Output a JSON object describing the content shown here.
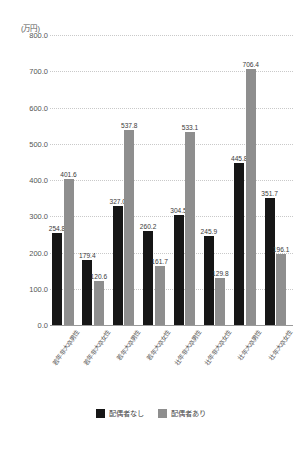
{
  "chart_data": {
    "type": "bar",
    "title": "",
    "subtitle": "",
    "xlabel": "",
    "ylabel": "",
    "unit_label": "(万円)",
    "grid": true,
    "legend_position": "bottom",
    "ylim": [
      0.0,
      800.0
    ],
    "ytick_step": 100.0,
    "ytick_labels": [
      "800.0",
      "700.0",
      "600.0",
      "500.0",
      "400.0",
      "300.0",
      "200.0",
      "100.0",
      "0.0"
    ],
    "ytick_values": [
      800.0,
      700.0,
      600.0,
      500.0,
      400.0,
      300.0,
      200.0,
      100.0,
      0.0
    ],
    "categories": [
      "若年非大卒男性",
      "若年非大卒女性",
      "若年大卒男性",
      "若年大卒女性",
      "壮年非大卒男性",
      "壮年非大卒女性",
      "壮年大卒男性",
      "壮年大卒女性"
    ],
    "series": [
      {
        "name": "配偶者なし",
        "color": "#161616",
        "values": [
          254.8,
          179.4,
          327.0,
          260.2,
          304.5,
          245.9,
          445.8,
          351.7
        ],
        "labels": [
          "254.8",
          "179.4",
          "327.0",
          "260.2",
          "304.5",
          "245.9",
          "445.8",
          "351.7"
        ]
      },
      {
        "name": "配偶者あり",
        "color": "#8e8e8e",
        "values": [
          401.6,
          120.6,
          537.8,
          161.7,
          533.1,
          129.8,
          706.4,
          196.1
        ],
        "labels": [
          "401.6",
          "120.6",
          "537.8",
          "161.7",
          "533.1",
          "129.8",
          "706.4",
          "196.1"
        ]
      }
    ]
  },
  "legend": {
    "items": [
      {
        "label": "配偶者なし",
        "color": "#161616"
      },
      {
        "label": "配偶者あり",
        "color": "#8e8e8e"
      }
    ]
  }
}
